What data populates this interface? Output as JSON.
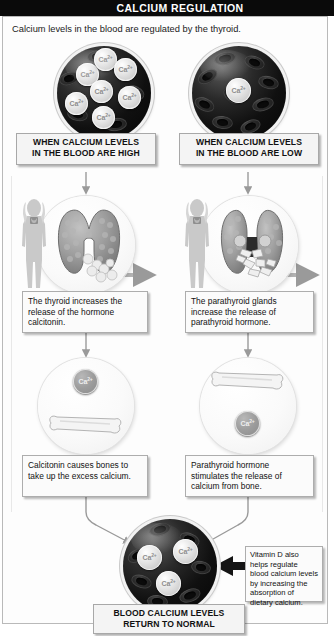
{
  "title": "CALCIUM REGULATION",
  "subtitle": "Calcium levels in the blood are regulated by the thyroid.",
  "ion_label": "Ca",
  "ion_charge": "2+",
  "branches": {
    "left": {
      "state_caption": "WHEN CALCIUM LEVELS\nIN THE BLOOD ARE HIGH",
      "state_caption_line1": "WHEN CALCIUM LEVELS",
      "state_caption_line2": "IN THE BLOOD ARE HIGH",
      "gland_text": "The thyroid increases the release of the hormone calcitonin.",
      "bone_text": "Calcitonin causes bones to take up the excess calcium.",
      "blood_ca_count": 7,
      "gland_name": "thyroid",
      "bone_flow": "calcium-into-bone"
    },
    "right": {
      "state_caption_line1": "WHEN CALCIUM LEVELS",
      "state_caption_line2": "IN THE BLOOD ARE LOW",
      "gland_text": "The parathyroid glands increase the release of parathyroid hormone.",
      "bone_text": "Parathyroid hormone stimulates the release of calcium from bone.",
      "blood_ca_count": 1,
      "gland_name": "parathyroid",
      "bone_flow": "calcium-out-of-bone"
    }
  },
  "vitamin_d_note": "Vitamin D also helps regulate blood calcium levels by increasing the absorption of dietary calcium.",
  "final_caption_line1": "BLOOD CALCIUM LEVELS",
  "final_caption_line2": "RETURN TO NORMAL",
  "final_blood_ca_count": 3,
  "colors": {
    "title_bar_bg": "#0a0a0a",
    "title_bar_text": "#ffffff",
    "frame_border": "#b9b9b9",
    "box_border": "#adadad",
    "box_bg": "#fbfbfb",
    "caption_bg": "#f4f4f4",
    "arrow": "#9a9a9a",
    "dark_arrow": "#1c1c1c",
    "ion_text": "#8d8d8d",
    "gland_fill": "#a9a9a9",
    "silhouette": "#c6c6c6",
    "bone_fill": "#f2f2f2"
  }
}
